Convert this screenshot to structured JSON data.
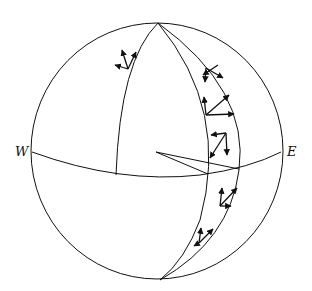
{
  "diagram": {
    "type": "sphere-with-meridians-and-local-frames",
    "labels": {
      "west": "W",
      "east": "E"
    },
    "colors": {
      "stroke": "#111111",
      "background": "#ffffff"
    },
    "vector_triads": [
      {
        "location": "upper-left meridian",
        "count": 3
      },
      {
        "location": "right band upper",
        "count": 3
      },
      {
        "location": "right band middle",
        "count": 3
      },
      {
        "location": "right band near equator",
        "count": 3
      },
      {
        "location": "right band below equator",
        "count": 3
      },
      {
        "location": "right band lower",
        "count": 3
      }
    ]
  }
}
